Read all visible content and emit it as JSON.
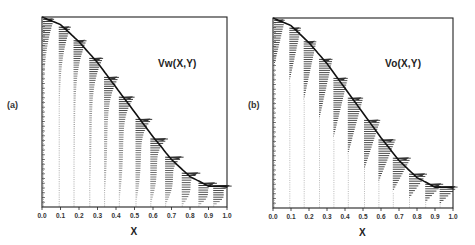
{
  "figure": {
    "panels": [
      {
        "id": "a",
        "label": "(a)",
        "field_label": "Vw(X,Y)",
        "xlabel": "X",
        "frame": {
          "left": 42,
          "top": 17,
          "right": 227,
          "bottom": 207
        },
        "label_pos": {
          "x": 7,
          "y": 100
        },
        "field_label_pos": {
          "x": 158,
          "y": 58
        }
      },
      {
        "id": "b",
        "label": "(b)",
        "field_label": "Vo(X,Y)",
        "xlabel": "X",
        "frame": {
          "left": 273,
          "top": 18,
          "right": 453,
          "bottom": 208
        },
        "label_pos": {
          "x": 248,
          "y": 100
        },
        "field_label_pos": {
          "x": 385,
          "y": 58
        }
      }
    ]
  },
  "chart_data": [
    {
      "type": "vector-field",
      "title": "Vw(X,Y)",
      "panel_label": "(a)",
      "xlabel": "X",
      "ylabel": "",
      "xlim": [
        0.0,
        1.0
      ],
      "x_ticks": [
        "0.0",
        "0.1",
        "0.2",
        "0.3",
        "0.4",
        "0.5",
        "0.6",
        "0.7",
        "0.8",
        "0.9",
        "1.0"
      ],
      "boundary_curve": {
        "x": [
          0.0,
          0.1,
          0.2,
          0.3,
          0.4,
          0.5,
          0.6,
          0.7,
          0.8,
          0.9,
          1.0
        ],
        "y_norm": [
          1.0,
          0.96,
          0.87,
          0.76,
          0.63,
          0.5,
          0.37,
          0.25,
          0.16,
          0.11,
          0.11
        ]
      },
      "profile_stations_x": [
        0.0,
        0.085,
        0.165,
        0.25,
        0.33,
        0.41,
        0.5,
        0.58,
        0.66,
        0.75,
        0.84,
        0.92
      ],
      "profile_style": "parabolic-wall",
      "grid": false,
      "legend": null
    },
    {
      "type": "vector-field",
      "title": "Vo(X,Y)",
      "panel_label": "(b)",
      "xlabel": "X",
      "ylabel": "",
      "xlim": [
        0.0,
        1.0
      ],
      "x_ticks": [
        "0.0",
        "0.1",
        "0.2",
        "0.3",
        "0.4",
        "0.5",
        "0.6",
        "0.7",
        "0.8",
        "0.9",
        "1.0"
      ],
      "boundary_curve": {
        "x": [
          0.0,
          0.1,
          0.2,
          0.3,
          0.4,
          0.5,
          0.6,
          0.7,
          0.8,
          0.9,
          1.0
        ],
        "y_norm": [
          1.0,
          0.96,
          0.87,
          0.76,
          0.63,
          0.5,
          0.37,
          0.25,
          0.16,
          0.11,
          0.11
        ]
      },
      "profile_stations_x": [
        0.0,
        0.085,
        0.165,
        0.25,
        0.33,
        0.41,
        0.5,
        0.58,
        0.66,
        0.75,
        0.84,
        0.92
      ],
      "profile_style": "triangular-surface",
      "grid": false,
      "legend": null
    }
  ]
}
